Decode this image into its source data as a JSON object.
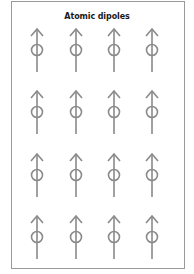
{
  "figure": {
    "title": "Atomic dipoles",
    "stroke_color": "#8a8a8a",
    "frame_color": "#9a9a9a",
    "grid": {
      "rows": 4,
      "columns": 4,
      "column_x": [
        37,
        76,
        114,
        152
      ],
      "row_circle_y": [
        50,
        112,
        175,
        237
      ],
      "orientation": "up"
    },
    "dipoles": [
      {
        "row": 1,
        "col": 1,
        "direction": "up"
      },
      {
        "row": 1,
        "col": 2,
        "direction": "up"
      },
      {
        "row": 1,
        "col": 3,
        "direction": "up"
      },
      {
        "row": 1,
        "col": 4,
        "direction": "up"
      },
      {
        "row": 2,
        "col": 1,
        "direction": "up"
      },
      {
        "row": 2,
        "col": 2,
        "direction": "up"
      },
      {
        "row": 2,
        "col": 3,
        "direction": "up"
      },
      {
        "row": 2,
        "col": 4,
        "direction": "up"
      },
      {
        "row": 3,
        "col": 1,
        "direction": "up"
      },
      {
        "row": 3,
        "col": 2,
        "direction": "up"
      },
      {
        "row": 3,
        "col": 3,
        "direction": "up"
      },
      {
        "row": 3,
        "col": 4,
        "direction": "up"
      },
      {
        "row": 4,
        "col": 1,
        "direction": "up"
      },
      {
        "row": 4,
        "col": 2,
        "direction": "up"
      },
      {
        "row": 4,
        "col": 3,
        "direction": "up"
      },
      {
        "row": 4,
        "col": 4,
        "direction": "up"
      }
    ]
  }
}
